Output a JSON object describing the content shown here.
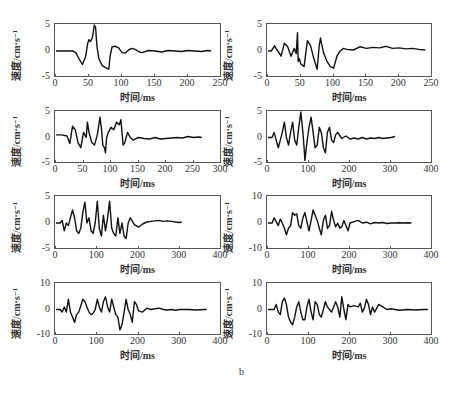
{
  "figure": {
    "caption": "b",
    "ylabel": "速度/cm·s⁻¹",
    "xlabel": "时间/ms"
  },
  "chart_data": [
    {
      "type": "line",
      "annotation": "5ms",
      "xlabel": "时间/ms",
      "ylabel": "速度/cm·s⁻¹",
      "xlim": [
        0,
        250
      ],
      "ylim": [
        -5,
        5
      ],
      "xticks": [
        0,
        50,
        100,
        150,
        200,
        250
      ],
      "yticks": [
        -5,
        0,
        5
      ],
      "grid": false,
      "x": [
        0,
        25,
        30,
        35,
        40,
        45,
        48,
        50,
        52,
        55,
        58,
        60,
        62,
        65,
        70,
        75,
        80,
        82,
        85,
        90,
        95,
        100,
        105,
        110,
        115,
        120,
        125,
        130,
        140,
        150,
        160,
        170,
        180,
        190,
        200,
        210,
        220,
        230,
        235
      ],
      "y": [
        0,
        0,
        -0.3,
        -1.5,
        -2.6,
        -1,
        1.5,
        2.2,
        1.8,
        2.5,
        5,
        4.5,
        1,
        -1.5,
        -2.8,
        -3.2,
        -3.5,
        -1,
        0.8,
        0.9,
        0.6,
        -0.3,
        -0.4,
        0.2,
        0.5,
        0.3,
        -0.1,
        -0.3,
        0.1,
        0,
        -0.2,
        0.1,
        0,
        -0.1,
        0.1,
        0,
        -0.1,
        0.1,
        0
      ]
    },
    {
      "type": "line",
      "annotation": "10ms",
      "xlabel": "时间/ms",
      "ylabel": "速度/cm·s⁻¹",
      "xlim": [
        0,
        250
      ],
      "ylim": [
        -5,
        5
      ],
      "xticks": [
        0,
        50,
        100,
        150,
        200,
        250
      ],
      "yticks": [
        -5,
        0,
        5
      ],
      "grid": false,
      "x": [
        0,
        5,
        10,
        12,
        15,
        20,
        25,
        30,
        35,
        40,
        43,
        45,
        46,
        48,
        50,
        55,
        60,
        65,
        70,
        75,
        78,
        80,
        82,
        85,
        90,
        95,
        100,
        105,
        110,
        115,
        120,
        130,
        140,
        150,
        160,
        170,
        180,
        190,
        200,
        210,
        220,
        230,
        240
      ],
      "y": [
        0,
        0,
        1,
        0.5,
        0,
        -1,
        1.5,
        0.8,
        -1,
        0.5,
        -0.5,
        3.5,
        -2,
        -1.5,
        -2.5,
        -3,
        2,
        1,
        -1.5,
        -3.5,
        1,
        2.5,
        1.2,
        -0.5,
        -2,
        -3,
        -3.3,
        -1,
        0,
        0.5,
        0.3,
        0.2,
        0.8,
        0.5,
        0.7,
        0.6,
        0.9,
        0.5,
        0.6,
        0.4,
        0.5,
        0.3,
        0.2
      ]
    },
    {
      "type": "line",
      "annotation": "15ms",
      "xlabel": "时间/ms",
      "ylabel": "速度/cm·s⁻¹",
      "xlim": [
        0,
        300
      ],
      "ylim": [
        -5,
        5
      ],
      "xticks": [
        0,
        50,
        100,
        150,
        200,
        250,
        300
      ],
      "yticks": [
        -5,
        0,
        5
      ],
      "grid": false,
      "x": [
        0,
        10,
        20,
        25,
        30,
        35,
        40,
        45,
        50,
        55,
        57,
        60,
        65,
        70,
        75,
        80,
        83,
        85,
        88,
        90,
        92,
        95,
        100,
        105,
        110,
        115,
        118,
        120,
        122,
        125,
        130,
        135,
        140,
        150,
        160,
        170,
        180,
        190,
        200,
        210,
        220,
        230,
        240,
        250,
        260,
        265
      ],
      "y": [
        0.5,
        0.5,
        0.3,
        -1.2,
        2.2,
        1.5,
        -1,
        -2,
        1,
        0,
        3,
        1,
        -1,
        -1.5,
        0.5,
        4,
        1.5,
        -1.5,
        -2,
        -3,
        0,
        1,
        2,
        1.5,
        3,
        2.5,
        3.5,
        1,
        -1.5,
        -1,
        1,
        0,
        -0.5,
        0,
        -0.2,
        -0.3,
        0,
        -0.3,
        -0.2,
        -0.1,
        0,
        -0.1,
        0.2,
        0,
        0.1,
        0
      ]
    },
    {
      "type": "line",
      "annotation": "20ms",
      "xlabel": "时间/ms",
      "ylabel": "速度/cm·s⁻¹",
      "xlim": [
        0,
        400
      ],
      "ylim": [
        -5,
        5
      ],
      "xticks": [
        0,
        100,
        200,
        300,
        400
      ],
      "yticks": [
        -5,
        0,
        5
      ],
      "grid": false,
      "x": [
        0,
        10,
        15,
        20,
        25,
        30,
        35,
        40,
        45,
        50,
        55,
        60,
        65,
        70,
        75,
        80,
        85,
        88,
        90,
        95,
        100,
        105,
        110,
        115,
        120,
        125,
        130,
        135,
        140,
        145,
        150,
        155,
        160,
        165,
        170,
        180,
        190,
        200,
        210,
        220,
        230,
        240,
        250,
        260,
        270,
        280,
        290,
        300,
        310
      ],
      "y": [
        0,
        0,
        1,
        -0.5,
        -2,
        -0.5,
        1,
        3,
        0,
        -1.5,
        1,
        3,
        -0.5,
        -1.5,
        2,
        5,
        1,
        -2,
        -4.5,
        -1,
        2,
        4,
        1,
        -2,
        -1.5,
        2,
        1,
        -2,
        -3,
        1,
        2,
        -0.5,
        -1,
        0.5,
        1,
        -0.2,
        0.3,
        -0.3,
        -0.1,
        -0.3,
        0,
        -0.3,
        -0.1,
        -0.2,
        0,
        -0.2,
        -0.1,
        0,
        0.2
      ]
    },
    {
      "type": "line",
      "annotation": "25ms",
      "xlabel": "时间/ms",
      "ylabel": "速度/cm·s⁻¹",
      "xlim": [
        0,
        400
      ],
      "ylim": [
        -5,
        5
      ],
      "xticks": [
        0,
        100,
        200,
        300,
        400
      ],
      "yticks": [
        -5,
        0,
        5
      ],
      "grid": false,
      "x": [
        0,
        10,
        15,
        20,
        25,
        30,
        35,
        40,
        45,
        50,
        55,
        60,
        65,
        70,
        75,
        80,
        85,
        90,
        95,
        100,
        105,
        110,
        115,
        120,
        125,
        130,
        135,
        140,
        145,
        150,
        155,
        160,
        165,
        170,
        175,
        180,
        190,
        200,
        210,
        220,
        230,
        240,
        250,
        260,
        270,
        280,
        290,
        300,
        305
      ],
      "y": [
        0,
        0,
        0.5,
        -1.5,
        0,
        -0.5,
        1,
        2.5,
        1,
        -1.5,
        -2,
        -1,
        2,
        4,
        0,
        1,
        -1.5,
        -2,
        0,
        4.2,
        -1,
        -2.5,
        1.5,
        -1.5,
        1,
        4.2,
        -1,
        -2,
        -2.5,
        1,
        -2,
        0,
        -2.5,
        -3,
        0,
        1,
        -0.3,
        -0.8,
        -0.2,
        0.2,
        0.3,
        0.4,
        0.5,
        0.3,
        0.4,
        0.3,
        0.2,
        0.1,
        0.2
      ]
    },
    {
      "type": "line",
      "annotation": "30ms",
      "xlabel": "时间/ms",
      "ylabel": "速度/cm·s⁻¹",
      "xlim": [
        0,
        400
      ],
      "ylim": [
        -10,
        10
      ],
      "xticks": [
        0,
        100,
        200,
        300,
        400
      ],
      "yticks": [
        -10,
        0,
        10
      ],
      "grid": false,
      "x": [
        0,
        10,
        15,
        20,
        25,
        30,
        35,
        40,
        45,
        50,
        55,
        60,
        65,
        70,
        75,
        80,
        85,
        90,
        95,
        100,
        105,
        110,
        115,
        120,
        125,
        130,
        135,
        140,
        145,
        150,
        155,
        160,
        165,
        170,
        175,
        180,
        185,
        190,
        195,
        200,
        210,
        220,
        230,
        240,
        250,
        260,
        270,
        280,
        290,
        300,
        310,
        320,
        330,
        340,
        350
      ],
      "y": [
        0,
        0,
        2,
        0.5,
        -1,
        1.5,
        0,
        -2,
        -4.5,
        -2,
        -1,
        4,
        3,
        3.5,
        -1,
        -2,
        2,
        4,
        0.5,
        -3,
        1,
        5,
        3,
        1,
        -2,
        -4.5,
        1,
        3,
        -2,
        -1,
        4.5,
        1,
        -1.5,
        0,
        -2,
        -1.5,
        1,
        -1,
        -3,
        0,
        0.5,
        1,
        0,
        0.3,
        -0.3,
        0.2,
        0,
        0.2,
        -0.2,
        0,
        0,
        0.1,
        0,
        0.1,
        0
      ]
    },
    {
      "type": "line",
      "annotation": "35ms",
      "xlabel": "时间/ms",
      "ylabel": "速度/cm·s⁻¹",
      "xlim": [
        0,
        400
      ],
      "ylim": [
        -10,
        10
      ],
      "xticks": [
        0,
        100,
        200,
        300,
        400
      ],
      "yticks": [
        -10,
        0,
        10
      ],
      "grid": false,
      "x": [
        0,
        10,
        15,
        20,
        25,
        30,
        35,
        40,
        45,
        50,
        55,
        60,
        65,
        70,
        75,
        80,
        85,
        90,
        95,
        100,
        105,
        110,
        115,
        120,
        125,
        130,
        135,
        140,
        145,
        150,
        155,
        160,
        165,
        170,
        175,
        180,
        185,
        190,
        195,
        200,
        210,
        220,
        230,
        240,
        250,
        260,
        270,
        280,
        290,
        300,
        320,
        340,
        360,
        365
      ],
      "y": [
        0,
        0,
        -1,
        1,
        -1,
        4,
        -1,
        -3,
        -5,
        -2,
        -1,
        1.5,
        4,
        3,
        1,
        -1,
        -2,
        -1.5,
        0,
        4,
        1,
        -1,
        3,
        5,
        1,
        -1,
        4,
        1,
        -2,
        -3,
        -8,
        -6,
        -1,
        4,
        0,
        -2,
        -5,
        3,
        2,
        -0.5,
        -1,
        0.5,
        0,
        0.3,
        0.5,
        0,
        -0.2,
        0,
        -0.3,
        0,
        0,
        -0.2,
        0,
        0
      ]
    },
    {
      "type": "line",
      "annotation": "40ms",
      "xlabel": "时间/ms",
      "ylabel": "速度/cm·s⁻¹",
      "xlim": [
        0,
        400
      ],
      "ylim": [
        -10,
        10
      ],
      "xticks": [
        0,
        100,
        200,
        300,
        400
      ],
      "yticks": [
        -10,
        0,
        10
      ],
      "grid": false,
      "x": [
        0,
        15,
        20,
        25,
        30,
        35,
        40,
        45,
        50,
        55,
        60,
        65,
        70,
        75,
        80,
        85,
        90,
        95,
        100,
        105,
        110,
        115,
        120,
        125,
        130,
        135,
        140,
        145,
        150,
        155,
        160,
        165,
        170,
        175,
        180,
        185,
        190,
        195,
        200,
        210,
        220,
        225,
        230,
        235,
        240,
        245,
        250,
        255,
        260,
        270,
        280,
        290,
        300,
        320,
        340,
        360,
        380,
        390
      ],
      "y": [
        0,
        0,
        2,
        -1,
        -2,
        3,
        4.5,
        2,
        -3,
        -5,
        -6,
        -3,
        1,
        3,
        -1,
        -4,
        -4,
        1,
        4,
        -1,
        -4,
        3,
        2,
        -2,
        -3,
        0,
        3,
        1,
        0,
        -1,
        1,
        3,
        1,
        -3,
        5,
        0,
        -4,
        2,
        1,
        1.5,
        1,
        2.5,
        -1,
        0.5,
        4,
        2,
        -2,
        1,
        -1,
        2,
        1,
        0,
        0.3,
        -0.3,
        0,
        -0.2,
        0,
        0
      ]
    }
  ]
}
